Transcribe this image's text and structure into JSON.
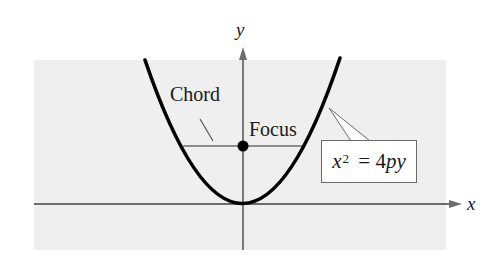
{
  "figure": {
    "panel_color": "#efefef",
    "axis_color": "#6d6d6d",
    "curve_color": "#000000",
    "labels": {
      "y_axis": "y",
      "x_axis": "x",
      "chord": "Chord",
      "focus": "Focus"
    },
    "equation": {
      "base": "x",
      "exponent": "2",
      "rest_eq": " = 4",
      "rest_vars": "py"
    },
    "elements": {
      "parabola": "x^2 = 4py (opens upward, vertex at origin)",
      "focus_point": "(0, p)",
      "chord": "horizontal line segment through the focus"
    }
  }
}
